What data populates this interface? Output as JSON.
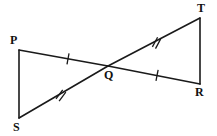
{
  "figure": {
    "name": "two-triangles-vertical-angles",
    "background_color": "#ffffff",
    "stroke_color": "#1a1a1a",
    "width": 217,
    "height": 136
  },
  "vertices": {
    "P": {
      "label": "P",
      "x": 19,
      "y": 50,
      "label_x": 10,
      "label_y": 34
    },
    "S": {
      "label": "S",
      "x": 19,
      "y": 118,
      "label_x": 13,
      "label_y": 121
    },
    "T": {
      "label": "T",
      "x": 200,
      "y": 18,
      "label_x": 197,
      "label_y": 2
    },
    "R": {
      "label": "R",
      "x": 200,
      "y": 84,
      "label_x": 195,
      "label_y": 86
    },
    "Q": {
      "label": "Q",
      "x": 108,
      "y": 66,
      "label_x": 104,
      "label_y": 69
    }
  },
  "segments": [
    {
      "name": "PS",
      "from": "P",
      "to": "S",
      "x1": 19,
      "y1": 50,
      "x2": 19,
      "y2": 118,
      "ticks": 0
    },
    {
      "name": "TR",
      "from": "T",
      "to": "R",
      "x1": 200,
      "y1": 18,
      "x2": 200,
      "y2": 84,
      "ticks": 0
    },
    {
      "name": "PQ",
      "from": "P",
      "to": "Q",
      "x1": 19,
      "y1": 50,
      "x2": 108,
      "y2": 66,
      "ticks": 1,
      "tick_x": 68,
      "tick_y": 58.8
    },
    {
      "name": "QR",
      "from": "Q",
      "to": "R",
      "x1": 108,
      "y1": 66,
      "x2": 200,
      "y2": 84,
      "ticks": 1,
      "tick_x": 157,
      "tick_y": 75.6
    },
    {
      "name": "SQ",
      "from": "S",
      "to": "Q",
      "x1": 19,
      "y1": 118,
      "x2": 108,
      "y2": 66,
      "ticks": 2,
      "tick_x": 60,
      "tick_y": 94.0
    },
    {
      "name": "QT",
      "from": "Q",
      "to": "T",
      "x1": 108,
      "y1": 66,
      "x2": 200,
      "y2": 18,
      "ticks": 2,
      "tick_x": 155,
      "tick_y": 41.5
    }
  ],
  "tick_marks": {
    "single_on": [
      "PQ",
      "QR"
    ],
    "double_on": [
      "SQ",
      "QT"
    ],
    "length": 11,
    "double_gap": 3.5
  }
}
